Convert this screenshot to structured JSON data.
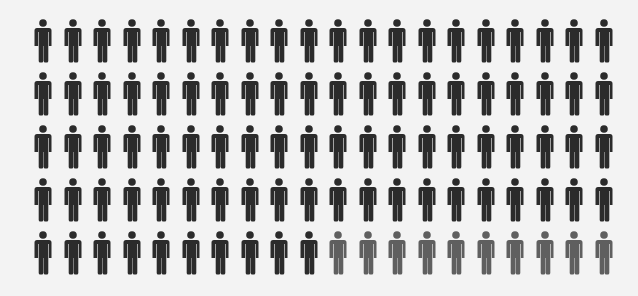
{
  "chart_data": {
    "type": "pictogram",
    "title": "",
    "total_icons": 100,
    "rows": 5,
    "columns": 20,
    "icon": "person-icon",
    "series": [
      {
        "name": "highlighted",
        "count": 90,
        "color": "#2b2b2b"
      },
      {
        "name": "remaining",
        "count": 10,
        "color": "#5f5f5f"
      }
    ],
    "xlabel": "",
    "ylabel": "",
    "legend": null
  },
  "layout": {
    "background": "#f3f3f3",
    "col_x_start": 34,
    "col_pitch": 29.5,
    "row_y": [
      19,
      72,
      125,
      178,
      231
    ]
  }
}
